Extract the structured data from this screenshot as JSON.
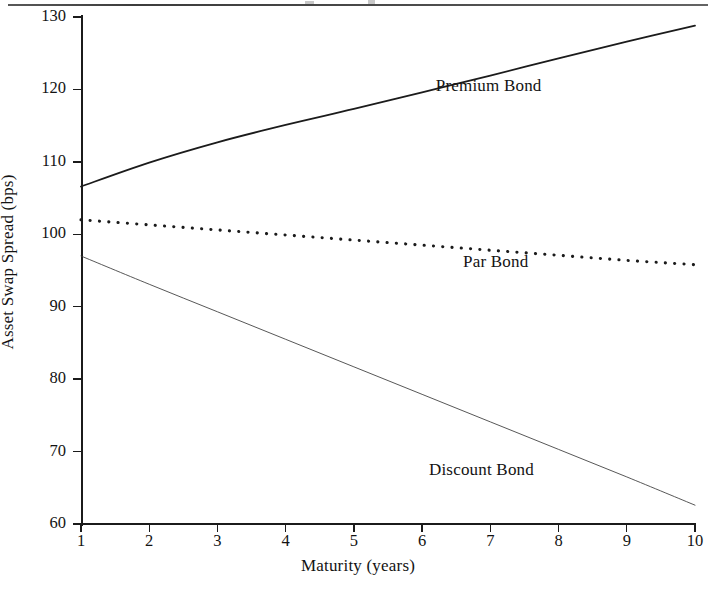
{
  "figure": {
    "top_rule": true,
    "background": "#ffffff",
    "ink_color": "#1b1b1b"
  },
  "chart_data": {
    "type": "line",
    "title": "",
    "subtitle": "",
    "xlabel": "Maturity (years)",
    "ylabel": "Asset Swap Spread (bps)",
    "xlim": [
      1,
      10
    ],
    "ylim": [
      60,
      130
    ],
    "xticks": [
      1,
      2,
      3,
      4,
      5,
      6,
      7,
      8,
      9,
      10
    ],
    "xtick_labels": [
      "1",
      "2",
      "3",
      "4",
      "5",
      "6",
      "7",
      "8",
      "9",
      "10"
    ],
    "yticks": [
      60,
      70,
      80,
      90,
      100,
      110,
      120,
      130
    ],
    "ytick_labels": [
      "60",
      "70",
      "80",
      "90",
      "100",
      "110",
      "120",
      "130"
    ],
    "grid": false,
    "legend_position": "inline-annotations",
    "x": [
      1,
      2,
      3,
      4,
      5,
      6,
      7,
      8,
      9,
      10
    ],
    "series": [
      {
        "name": "Premium Bond",
        "style": "solid",
        "color": "#1b1b1b",
        "width": 1.8,
        "values": [
          106.6,
          109.9,
          112.7,
          115.1,
          117.3,
          119.6,
          121.9,
          124.3,
          126.6,
          128.8
        ],
        "label": "Premium Bond",
        "label_x": 6.2,
        "label_y": 120.5
      },
      {
        "name": "Par Bond",
        "style": "dotted",
        "color": "#1b1b1b",
        "width": 2.6,
        "values": [
          102.0,
          101.3,
          100.6,
          99.9,
          99.2,
          98.5,
          97.8,
          97.1,
          96.4,
          95.8
        ],
        "label": "Par Bond",
        "label_x": 6.6,
        "label_y": 96.2
      },
      {
        "name": "Discount Bond",
        "style": "thin",
        "color": "#3a3a3a",
        "width": 1.0,
        "values": [
          97.0,
          93.1,
          89.3,
          85.5,
          81.7,
          77.9,
          74.1,
          70.3,
          66.5,
          62.6
        ],
        "label": "Discount Bond",
        "label_x": 6.1,
        "label_y": 67.4
      }
    ]
  }
}
